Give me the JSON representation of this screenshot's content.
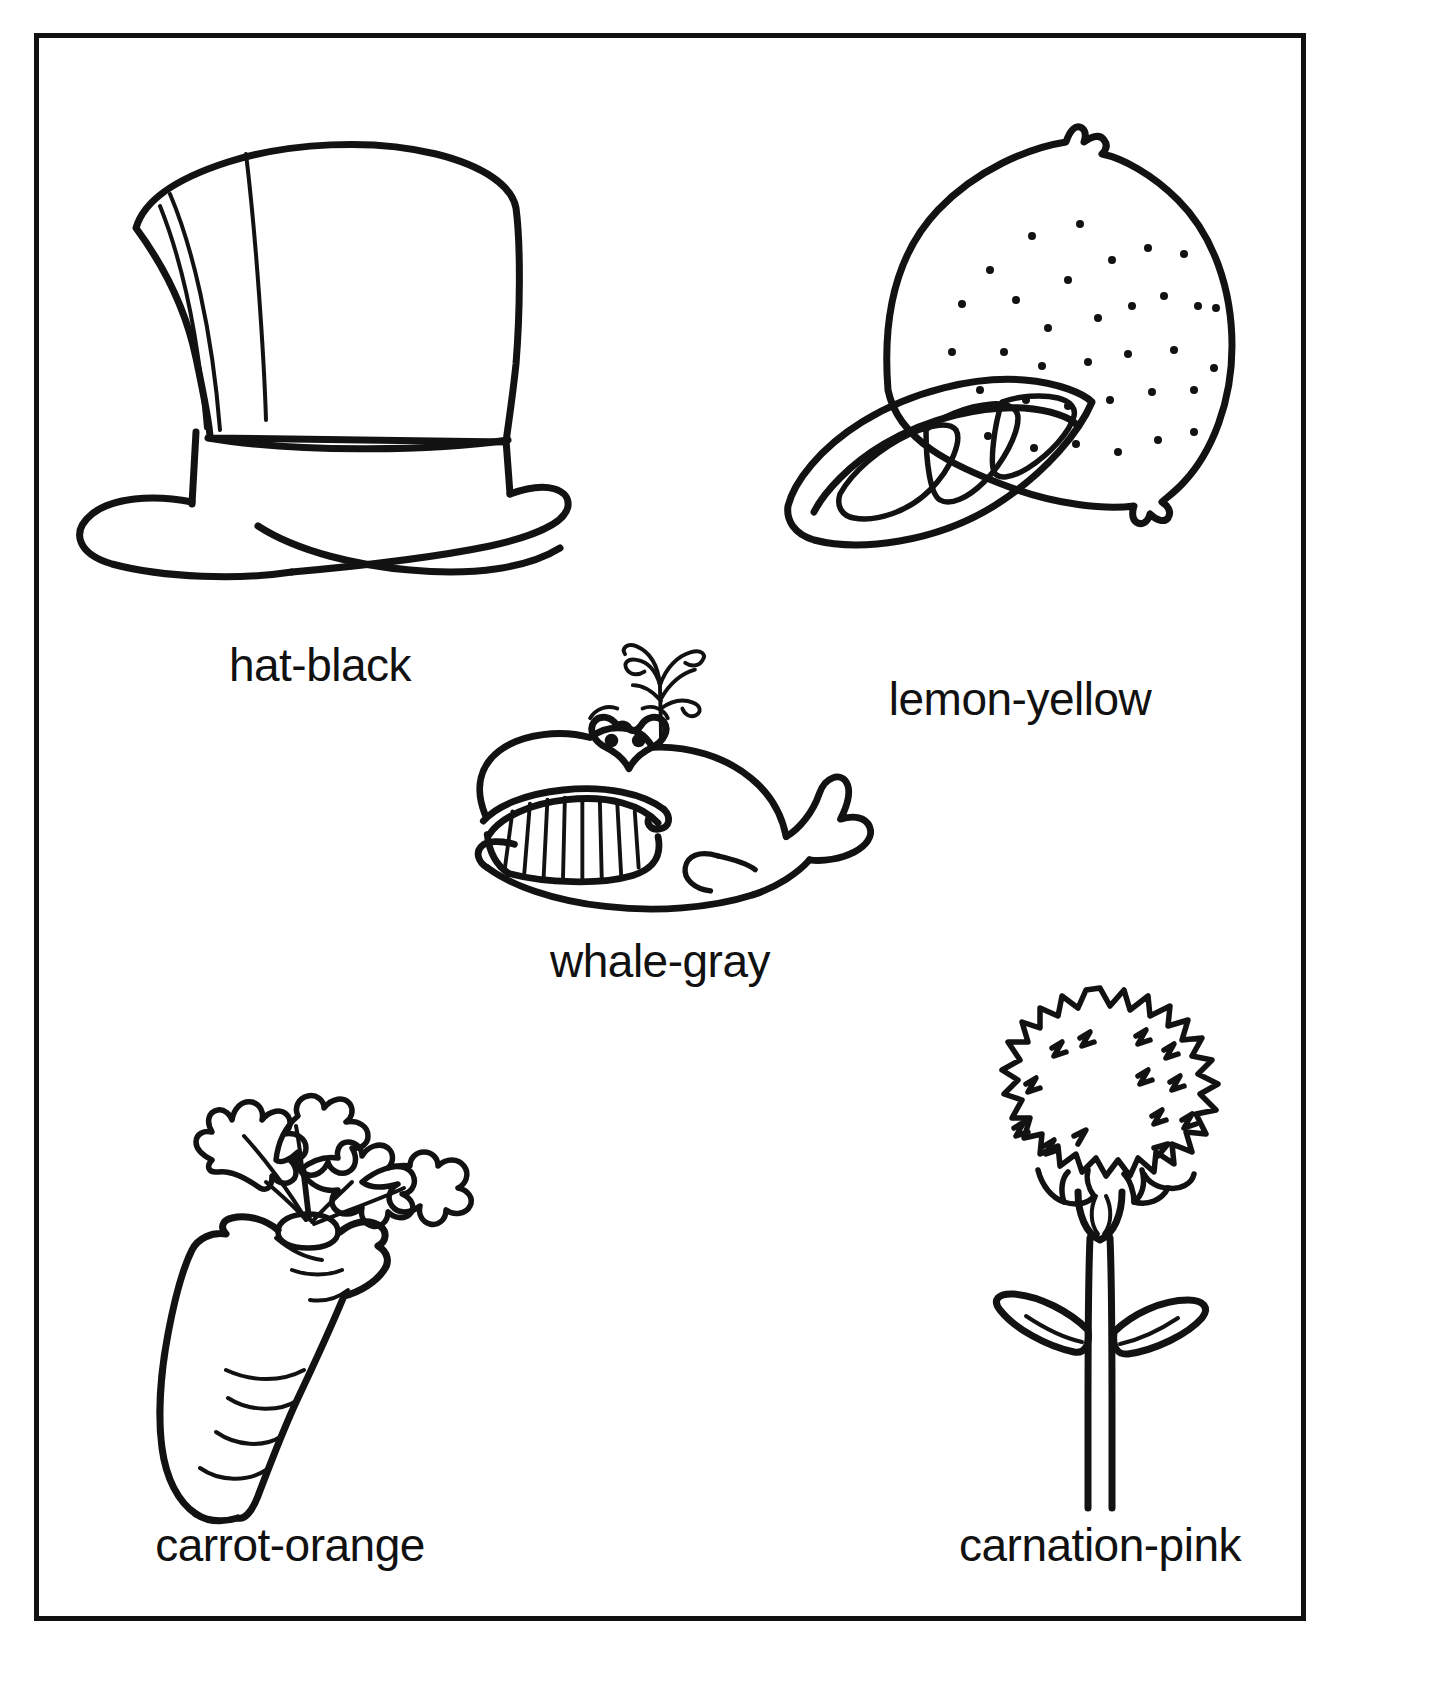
{
  "page": {
    "background_color": "#ffffff",
    "ink_color": "#121212",
    "frame": {
      "border_color": "#111111",
      "border_width_px": 5
    }
  },
  "figures": [
    {
      "id": "hat",
      "icon": "top-hat-icon",
      "caption": "hat-black",
      "object_word": "hat",
      "color_word": "black"
    },
    {
      "id": "lemon",
      "icon": "lemon-icon",
      "caption": "lemon-yellow",
      "object_word": "lemon",
      "color_word": "yellow"
    },
    {
      "id": "whale",
      "icon": "whale-icon",
      "caption": "whale-gray",
      "object_word": "whale",
      "color_word": "gray"
    },
    {
      "id": "carrot",
      "icon": "carrot-icon",
      "caption": "carrot-orange",
      "object_word": "carrot",
      "color_word": "orange"
    },
    {
      "id": "carnation",
      "icon": "carnation-flower-icon",
      "caption": "carnation-pink",
      "object_word": "carnation",
      "color_word": "pink"
    }
  ]
}
